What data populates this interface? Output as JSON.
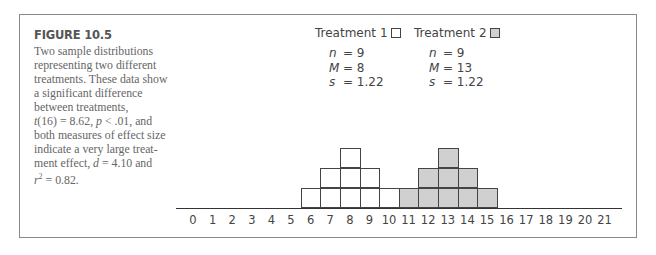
{
  "figure": {
    "label": "FIGURE 10.5",
    "caption_parts": {
      "line1": "Two sample distributions",
      "line2": "representing two different",
      "line3": "treatments. These data show",
      "line4": "a significant difference",
      "line5": "between treatments,",
      "line6_t": "t",
      "line6_rest": "(16) = 8.62, ",
      "line6_p": "p",
      "line6_end": " < .01, and",
      "line7": "both measures of effect size",
      "line8": "indicate a very large treat-",
      "line9_start": "ment effect, ",
      "line9_d": "d",
      "line9_end": " = 4.10 and",
      "line10_r": "r",
      "line10_sup": "2",
      "line10_end": " = 0.82."
    }
  },
  "legend": {
    "t1": {
      "label": "Treatment 1",
      "n_sym": "n",
      "n": "= 9",
      "m_sym": "M",
      "m": "= 8",
      "s_sym": "s",
      "s": "= 1.22",
      "fill": "#ffffff"
    },
    "t2": {
      "label": "Treatment 2",
      "n_sym": "n",
      "n": "= 9",
      "m_sym": "M",
      "m": "= 13",
      "s_sym": "s",
      "s": "= 1.22",
      "fill": "#d0d0d0"
    }
  },
  "chart_data": {
    "type": "bar",
    "xlabel": "",
    "ylabel": "",
    "x": [
      0,
      1,
      2,
      3,
      4,
      5,
      6,
      7,
      8,
      9,
      10,
      11,
      12,
      13,
      14,
      15,
      16,
      17,
      18,
      19,
      20,
      21
    ],
    "categories": [
      "0",
      "1",
      "2",
      "3",
      "4",
      "5",
      "6",
      "7",
      "8",
      "9",
      "10",
      "11",
      "12",
      "13",
      "14",
      "15",
      "16",
      "17",
      "18",
      "19",
      "20",
      "21"
    ],
    "series": [
      {
        "name": "Treatment 1",
        "color": "#ffffff",
        "values": [
          0,
          0,
          0,
          0,
          0,
          0,
          1,
          2,
          3,
          2,
          1,
          0,
          0,
          0,
          0,
          0,
          0,
          0,
          0,
          0,
          0,
          0
        ],
        "n": 9,
        "M": 8,
        "s": 1.22
      },
      {
        "name": "Treatment 2",
        "color": "#d0d0d0",
        "values": [
          0,
          0,
          0,
          0,
          0,
          0,
          0,
          0,
          0,
          0,
          0,
          1,
          2,
          3,
          2,
          1,
          0,
          0,
          0,
          0,
          0,
          0
        ],
        "n": 9,
        "M": 13,
        "s": 1.22
      }
    ],
    "ylim": [
      0,
      3
    ],
    "grid": false,
    "legend_position": "top",
    "annotations": [
      "t(16) = 8.62, p < .01",
      "d = 4.10",
      "r^2 = 0.82"
    ]
  }
}
